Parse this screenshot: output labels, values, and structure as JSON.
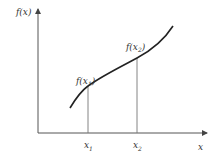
{
  "diagram": {
    "y_axis_label": "f(x)",
    "x_axis_label": "x",
    "points": [
      {
        "x_label": "x",
        "x_sub": "1",
        "y_label": "f(x",
        "y_sub": "1",
        "y_close": ")"
      },
      {
        "x_label": "x",
        "x_sub": "2",
        "y_label": "f(x",
        "y_sub": "2",
        "y_close": ")"
      }
    ],
    "colors": {
      "axis": "#555555",
      "curve": "#222222",
      "guide": "#777777",
      "text": "#333333"
    }
  }
}
